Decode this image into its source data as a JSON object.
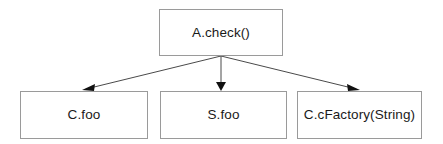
{
  "diagram": {
    "type": "call-graph",
    "background_color": "#ffffff",
    "box_border_color": "#9a9a9a",
    "box_fill_color": "#ffffff",
    "edge_color": "#4a4a4a",
    "arrowhead_color": "#111111",
    "text_color": "#1a1a1a",
    "nodes": [
      {
        "id": "root",
        "label": "A.check()",
        "role": "caller",
        "x": 159,
        "y": 9,
        "width": 124,
        "height": 47
      },
      {
        "id": "cfoo",
        "label": "C.foo",
        "role": "callee",
        "x": 20,
        "y": 91,
        "width": 128,
        "height": 48
      },
      {
        "id": "sfoo",
        "label": "S.foo",
        "role": "callee",
        "x": 160,
        "y": 91,
        "width": 127,
        "height": 48
      },
      {
        "id": "cfactory",
        "label": "C.cFactory(String)",
        "role": "callee",
        "x": 297,
        "y": 91,
        "width": 125,
        "height": 48
      }
    ],
    "edges": [
      {
        "id": "root-to-cfoo",
        "from": "root",
        "to": "cfoo",
        "from_x": 221,
        "from_y": 56,
        "to_x": 84,
        "to_y": 90,
        "arrowhead": "filled-triangle",
        "label": ""
      },
      {
        "id": "root-to-sfoo",
        "from": "root",
        "to": "sfoo",
        "from_x": 221,
        "from_y": 56,
        "to_x": 221,
        "to_y": 90,
        "arrowhead": "filled-triangle",
        "label": ""
      },
      {
        "id": "root-to-cfactory",
        "from": "root",
        "to": "cfactory",
        "from_x": 221,
        "from_y": 56,
        "to_x": 358,
        "to_y": 90,
        "arrowhead": "filled-triangle",
        "label": ""
      }
    ]
  }
}
